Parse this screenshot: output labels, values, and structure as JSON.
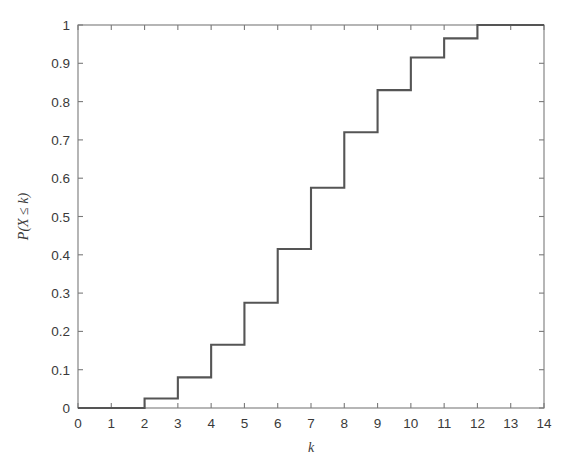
{
  "figure": {
    "background": "#ffffff",
    "line_color": "#555555",
    "axis_color": "#7a7a7a",
    "text_color": "#3a3a3a"
  },
  "chart_data": {
    "type": "line",
    "subtype": "step-post cumulative distribution function",
    "title": "",
    "xlabel": "k",
    "ylabel": "P(X ≤ k)",
    "xlim": [
      0,
      14
    ],
    "ylim": [
      0,
      1
    ],
    "grid": false,
    "legend": null,
    "xticks": [
      0,
      1,
      2,
      3,
      4,
      5,
      6,
      7,
      8,
      9,
      10,
      11,
      12,
      13,
      14
    ],
    "xticklabels": [
      "0",
      "1",
      "2",
      "3",
      "4",
      "5",
      "6",
      "7",
      "8",
      "9",
      "10",
      "11",
      "12",
      "13",
      "14"
    ],
    "yticks": [
      0,
      0.1,
      0.2,
      0.3,
      0.4,
      0.5,
      0.6,
      0.7,
      0.8,
      0.9,
      1
    ],
    "yticklabels": [
      "0",
      "0.1",
      "0.2",
      "0.3",
      "0.4",
      "0.5",
      "0.6",
      "0.7",
      "0.8",
      "0.9",
      "1"
    ],
    "x": [
      0,
      1,
      2,
      3,
      4,
      5,
      6,
      7,
      8,
      9,
      10,
      11,
      12,
      13,
      14
    ],
    "values": [
      0,
      0,
      0.025,
      0.08,
      0.165,
      0.275,
      0.415,
      0.575,
      0.72,
      0.83,
      0.915,
      0.965,
      1.0,
      1.0,
      1.0
    ],
    "series": [
      {
        "name": "P(X ≤ k)",
        "values": [
          0,
          0,
          0.025,
          0.08,
          0.165,
          0.275,
          0.415,
          0.575,
          0.72,
          0.83,
          0.915,
          0.965,
          1.0,
          1.0,
          1.0
        ]
      }
    ]
  }
}
